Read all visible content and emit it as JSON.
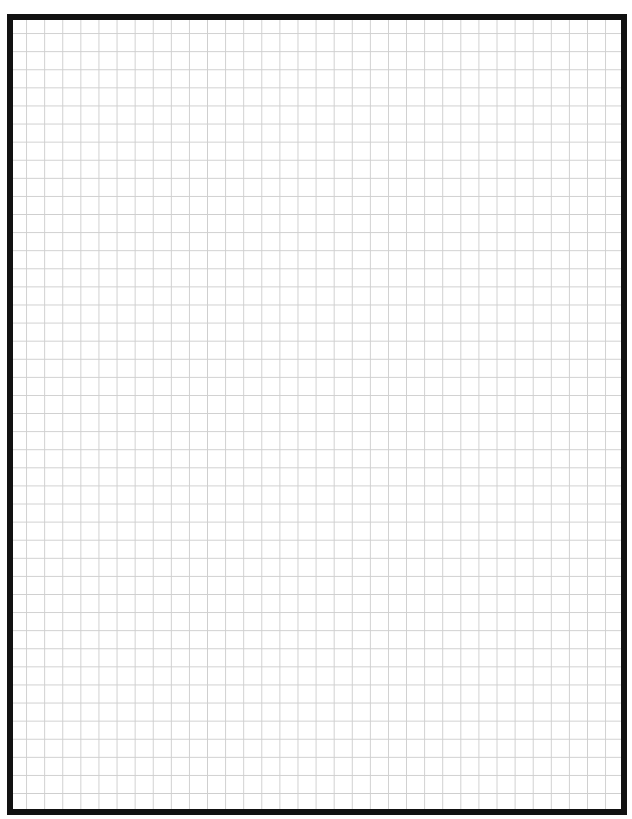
{
  "page": {
    "type": "graph-paper",
    "width": 632,
    "height": 819,
    "background_color": "#ffffff"
  },
  "frame": {
    "border_color": "#111111",
    "border_width": 6
  },
  "grid": {
    "line_color": "#cfcfcf",
    "cell_size_px": 18.1,
    "columns": 33,
    "rows": 44
  }
}
